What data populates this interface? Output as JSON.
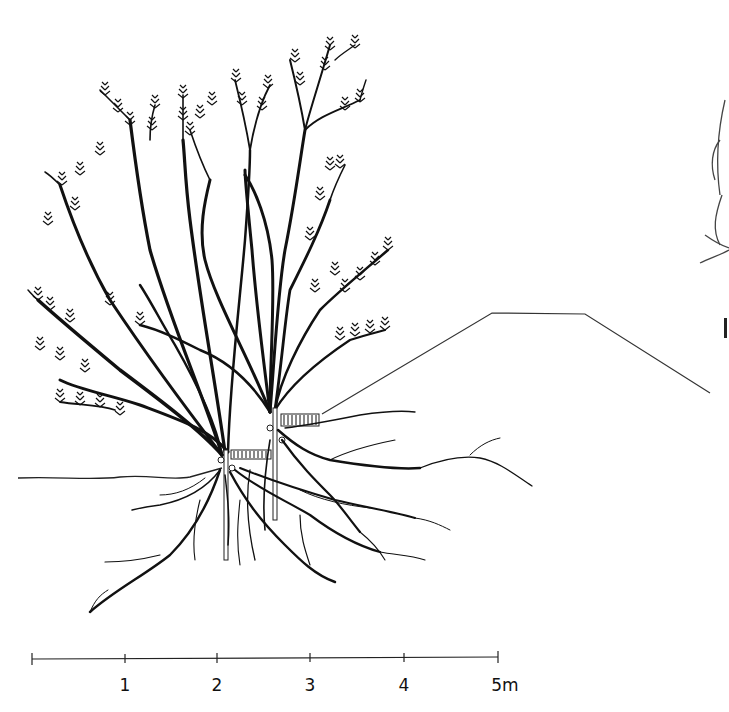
{
  "figure": {
    "ink_color": "#111111",
    "background": "#ffffff"
  },
  "scale_bar": {
    "unit": "m",
    "ticks": [
      {
        "value": 0,
        "label": "",
        "x": 32
      },
      {
        "value": 1,
        "label": "1",
        "x": 125
      },
      {
        "value": 2,
        "label": "2",
        "x": 217
      },
      {
        "value": 3,
        "label": "3",
        "x": 310
      },
      {
        "value": 4,
        "label": "4",
        "x": 404
      },
      {
        "value": 5,
        "label": "5m",
        "x": 498
      }
    ]
  },
  "terrain_profile": {
    "points": [
      [
        322,
        414
      ],
      [
        492,
        313
      ],
      [
        585,
        314
      ],
      [
        710,
        393
      ]
    ]
  },
  "ground_line": {
    "y": 478
  }
}
